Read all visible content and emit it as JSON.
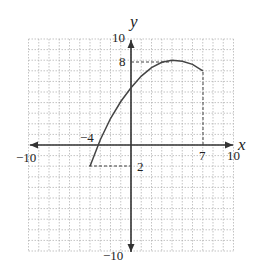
{
  "chart_data": {
    "type": "line",
    "title": "",
    "xlabel": "x",
    "ylabel": "y",
    "xlim": [
      -10,
      10
    ],
    "ylim": [
      -10,
      10
    ],
    "grid": true,
    "grid_step": 1,
    "tick_labels": {
      "x": [
        "-10",
        "-4",
        "7",
        "10"
      ],
      "y": [
        "10",
        "8",
        "-2",
        "-10"
      ]
    },
    "series": [
      {
        "name": "f(x)",
        "x": [
          -4,
          -3,
          -2,
          -1,
          0,
          1,
          2,
          3,
          4,
          5,
          6,
          7
        ],
        "y": [
          -2,
          0.5,
          2.5,
          4.1,
          5.4,
          6.5,
          7.3,
          7.8,
          8,
          7.9,
          7.6,
          7
        ]
      }
    ],
    "annotations": [
      {
        "type": "dashed-guide",
        "from": [
          -4,
          -2
        ],
        "to": [
          0,
          -2
        ],
        "label": "-2"
      },
      {
        "type": "dashed-guide",
        "from": [
          0,
          8
        ],
        "to": [
          4,
          8
        ],
        "label": "8"
      },
      {
        "type": "dashed-guide",
        "from": [
          7,
          7
        ],
        "to": [
          7,
          0
        ],
        "label": "7"
      },
      {
        "type": "point-label",
        "at": [
          -4,
          0
        ],
        "label": "-4"
      }
    ]
  },
  "labels": {
    "x_axis": "x",
    "y_axis": "y",
    "x_min": "−10",
    "x_max": "10",
    "y_max": "10",
    "y_min": "−10",
    "y_eight": "8",
    "y_neg_two": "2",
    "x_neg_four": "−4",
    "x_seven": "7"
  }
}
